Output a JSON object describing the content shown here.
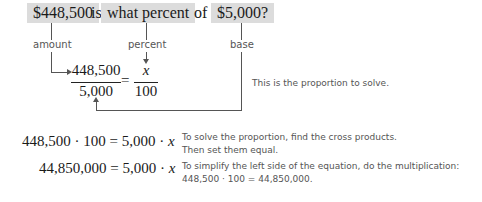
{
  "question": {
    "amount_box": "$448,500",
    "is_word": "is",
    "percent_box": "what percent",
    "of_word": "of",
    "base_box": "$5,000?"
  },
  "labels": {
    "amount": "amount",
    "percent": "percent",
    "base": "base"
  },
  "proportion": {
    "numerator_left": "448,500",
    "denominator_left": "5,000",
    "equals": "=",
    "numerator_right": "x",
    "denominator_right": "100",
    "note": "This is the proportion to solve."
  },
  "steps": [
    {
      "lhs": "448,500 · 100",
      "equals": "=",
      "rhs_num": "5,000 ·",
      "rhs_var": "x",
      "note_line1": "To solve the proportion, find the cross products.",
      "note_line2": "Then set them equal."
    },
    {
      "lhs": "44,850,000",
      "equals": "=",
      "rhs_num": "5,000 ·",
      "rhs_var": "x",
      "note_line1": "To simplify the left side of the equation, do the multiplication:",
      "note_line2": "448,500 · 100 = 44,850,000."
    }
  ]
}
